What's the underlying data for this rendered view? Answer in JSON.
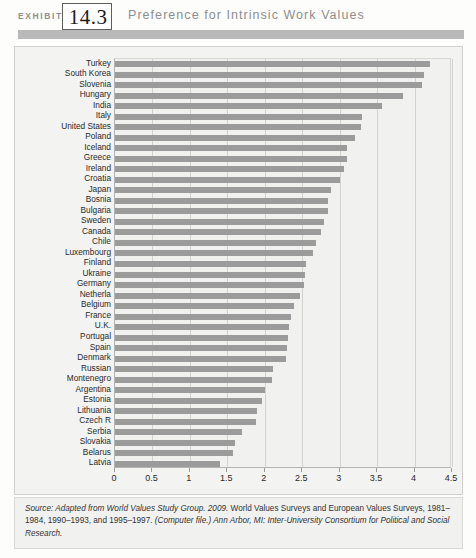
{
  "header": {
    "exhibit_word": "EXHIBIT",
    "exhibit_number": "14.3",
    "title": "Preference for Intrinsic Work Values"
  },
  "source": {
    "label": "Source:",
    "part1": " Adapted from World Values Study Group. 2009.",
    "part2": " World Values Surveys and European Values Surveys, 1981–1984, 1990–1993, and 1995–1997.",
    "part3": " (Computer file.) Ann Arbor, MI: Inter-University Consortium for Political and Social Research."
  },
  "chart_data": {
    "type": "bar",
    "orientation": "horizontal",
    "title": "Preference for Intrinsic Work Values",
    "xlabel": "",
    "ylabel": "",
    "xlim": [
      0,
      4.5
    ],
    "grid": true,
    "legend": false,
    "bar_color": "#9b9b9b",
    "xticks": [
      "0",
      "0.5",
      "1",
      "1.5",
      "2",
      "2.5",
      "3",
      "3.5",
      "4",
      "4.5"
    ],
    "xtick_values": [
      0,
      0.5,
      1,
      1.5,
      2,
      2.5,
      3,
      3.5,
      4,
      4.5
    ],
    "categories": [
      "Turkey",
      "South Korea",
      "Slovenia",
      "Hungary",
      "India",
      "Italy",
      "United States",
      "Poland",
      "Iceland",
      "Greece",
      "Ireland",
      "Croatia",
      "Japan",
      "Bosnia",
      "Bulgaria",
      "Sweden",
      "Canada",
      "Chile",
      "Luxembourg",
      "Finland",
      "Ukraine",
      "Germany",
      "Netherla",
      "Belgium",
      "France",
      "U.K.",
      "Portugal",
      "Spain",
      "Denmark",
      "Russian",
      "Montenegro",
      "Argentina",
      "Estonia",
      "Lithuania",
      "Czech R",
      "Serbia",
      "Slovakia",
      "Belarus",
      "Latvia"
    ],
    "values": [
      4.2,
      4.13,
      4.1,
      3.85,
      3.57,
      3.3,
      3.28,
      3.2,
      3.1,
      3.1,
      3.06,
      3.0,
      2.88,
      2.85,
      2.84,
      2.79,
      2.75,
      2.68,
      2.65,
      2.55,
      2.54,
      2.53,
      2.47,
      2.39,
      2.35,
      2.32,
      2.31,
      2.3,
      2.28,
      2.11,
      2.1,
      2.0,
      1.96,
      1.89,
      1.88,
      1.69,
      1.6,
      1.58,
      1.4
    ]
  }
}
